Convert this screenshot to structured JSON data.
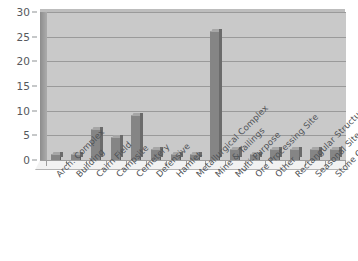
{
  "chart_data": {
    "type": "bar",
    "title": "",
    "subtitle": "",
    "xlabel": "",
    "ylabel": "",
    "ylim": [
      0,
      30
    ],
    "yticks": [
      0,
      5,
      10,
      15,
      20,
      25,
      30
    ],
    "ytick_labels": [
      "0",
      "5",
      "10",
      "15",
      "20",
      "25",
      "30"
    ],
    "grid": true,
    "legend": false,
    "legend_position": "none",
    "bar_color": "#858585",
    "plot_background": "#c9c9c9",
    "gridline_color": "#9a9a9a",
    "categories": [
      "Arch. Complex",
      "Building",
      "Cairn Field",
      "Campsite",
      "Cemetery",
      "Defensive",
      "Hamlet",
      "Metallurgical Complex",
      "Mine & Tailings",
      "Multi-Purpose",
      "Ore Processing Site",
      "Other",
      "Rectangular Structure",
      "Seasonal Site",
      "Stone Circle"
    ],
    "values": [
      1,
      1,
      6,
      4.5,
      9,
      2,
      1,
      1,
      26,
      2,
      1,
      2,
      2,
      2,
      2
    ]
  }
}
